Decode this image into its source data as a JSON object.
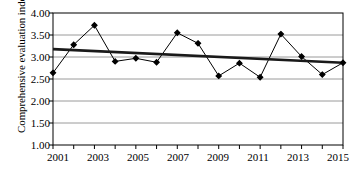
{
  "chart_data": {
    "type": "line",
    "title": "",
    "xlabel": "",
    "ylabel": "Comprehensive evaluation index",
    "x": [
      2001,
      2002,
      2003,
      2004,
      2005,
      2006,
      2007,
      2008,
      2009,
      2010,
      2011,
      2012,
      2013,
      2014,
      2015
    ],
    "categories": [
      "2001",
      "2002",
      "2003",
      "2004",
      "2005",
      "2006",
      "2007",
      "2008",
      "2009",
      "2010",
      "2011",
      "2012",
      "2013",
      "2014",
      "2015"
    ],
    "values": [
      2.64,
      3.28,
      3.72,
      2.9,
      2.97,
      2.88,
      3.55,
      3.31,
      2.57,
      2.86,
      2.54,
      3.52,
      3.01,
      2.6,
      2.87
    ],
    "series": [
      {
        "name": "Comprehensive evaluation index",
        "values": [
          2.64,
          3.28,
          3.72,
          2.9,
          2.97,
          2.88,
          3.55,
          3.31,
          2.57,
          2.86,
          2.54,
          3.52,
          3.01,
          2.6,
          2.87
        ],
        "marker": "filled-diamond",
        "color": "#000000"
      },
      {
        "name": "linear trend",
        "values": [
          3.18,
          3.156,
          3.134,
          3.112,
          3.09,
          3.068,
          3.046,
          3.024,
          3.002,
          2.98,
          2.958,
          2.936,
          2.914,
          2.892,
          2.87
        ],
        "color": "#1a1a1a",
        "style": "thick-straight"
      }
    ],
    "ylim": [
      1.0,
      4.0
    ],
    "ytick_step": 0.5,
    "ytick_labels": [
      "1.00",
      "1.50",
      "2.00",
      "2.50",
      "3.00",
      "3.50",
      "4.00"
    ],
    "xlim": [
      2001,
      2015
    ],
    "xtick_labels_shown": [
      "2001",
      "2003",
      "2005",
      "2007",
      "2009",
      "2011",
      "2013",
      "2015"
    ],
    "xtick_minor_every": 1,
    "grid": "horizontal",
    "legend": "none",
    "legend_position": "none",
    "annotations": []
  }
}
